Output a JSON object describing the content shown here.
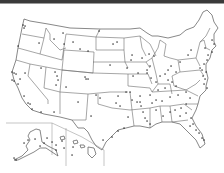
{
  "map": {
    "title": "",
    "type": "us-locations-dot-map",
    "colors": {
      "background": "#ffffff",
      "borders": "#6b6b6b",
      "dots": "#222222",
      "topbar": "#3a3a3a"
    },
    "insets": [
      "Alaska",
      "Hawaii"
    ],
    "points": [
      [
        23,
        25
      ],
      [
        25,
        26
      ],
      [
        24,
        28
      ],
      [
        18,
        46
      ],
      [
        39,
        43
      ],
      [
        63,
        33
      ],
      [
        64,
        44
      ],
      [
        73,
        42
      ],
      [
        54,
        39
      ],
      [
        80,
        49
      ],
      [
        88,
        51
      ],
      [
        99,
        31
      ],
      [
        41,
        68
      ],
      [
        12,
        72
      ],
      [
        14,
        73
      ],
      [
        16,
        74
      ],
      [
        25,
        73
      ],
      [
        20,
        79
      ],
      [
        14,
        81
      ],
      [
        12,
        80
      ],
      [
        18,
        84
      ],
      [
        55,
        72
      ],
      [
        57,
        76
      ],
      [
        58,
        80
      ],
      [
        56,
        85
      ],
      [
        85,
        77
      ],
      [
        86,
        79
      ],
      [
        88,
        79
      ],
      [
        66,
        87
      ],
      [
        24,
        96
      ],
      [
        28,
        103
      ],
      [
        30,
        104
      ],
      [
        32,
        109
      ],
      [
        41,
        112
      ],
      [
        54,
        112
      ],
      [
        78,
        102
      ],
      [
        91,
        116
      ],
      [
        113,
        44
      ],
      [
        117,
        42
      ],
      [
        110,
        65
      ],
      [
        132,
        55
      ],
      [
        142,
        58
      ],
      [
        149,
        54
      ],
      [
        154,
        56
      ],
      [
        150,
        66
      ],
      [
        147,
        70
      ],
      [
        131,
        60
      ],
      [
        127,
        68
      ],
      [
        133,
        76
      ],
      [
        138,
        73
      ],
      [
        147,
        73
      ],
      [
        151,
        78
      ],
      [
        156,
        82
      ],
      [
        160,
        76
      ],
      [
        165,
        74
      ],
      [
        168,
        70
      ],
      [
        171,
        66
      ],
      [
        176,
        72
      ],
      [
        180,
        62
      ],
      [
        188,
        55
      ],
      [
        191,
        50
      ],
      [
        205,
        48
      ],
      [
        212,
        40
      ],
      [
        214,
        44
      ],
      [
        212,
        52
      ],
      [
        208,
        55
      ],
      [
        207,
        60
      ],
      [
        204,
        64
      ],
      [
        200,
        68
      ],
      [
        202,
        70
      ],
      [
        206,
        72
      ],
      [
        203,
        76
      ],
      [
        205,
        79
      ],
      [
        204,
        84
      ],
      [
        207,
        88
      ],
      [
        168,
        80
      ],
      [
        172,
        82
      ],
      [
        176,
        86
      ],
      [
        165,
        88
      ],
      [
        158,
        90
      ],
      [
        150,
        95
      ],
      [
        140,
        96
      ],
      [
        130,
        92
      ],
      [
        118,
        96
      ],
      [
        116,
        103
      ],
      [
        120,
        106
      ],
      [
        96,
        95
      ],
      [
        100,
        98
      ],
      [
        126,
        92
      ],
      [
        132,
        100
      ],
      [
        140,
        102
      ],
      [
        152,
        103
      ],
      [
        156,
        100
      ],
      [
        162,
        101
      ],
      [
        170,
        97
      ],
      [
        178,
        95
      ],
      [
        186,
        92
      ],
      [
        190,
        98
      ],
      [
        186,
        104
      ],
      [
        181,
        108
      ],
      [
        137,
        102
      ],
      [
        141,
        106
      ],
      [
        143,
        112
      ],
      [
        145,
        118
      ],
      [
        147,
        121
      ],
      [
        150,
        124
      ],
      [
        156,
        110
      ],
      [
        163,
        116
      ],
      [
        170,
        112
      ],
      [
        175,
        110
      ],
      [
        180,
        116
      ],
      [
        186,
        113
      ],
      [
        191,
        118
      ],
      [
        193,
        124
      ],
      [
        196,
        130
      ],
      [
        199,
        133
      ],
      [
        202,
        138
      ],
      [
        204,
        140
      ],
      [
        190,
        126
      ],
      [
        128,
        117
      ],
      [
        124,
        128
      ],
      [
        118,
        131
      ],
      [
        112,
        137
      ],
      [
        103,
        140
      ],
      [
        24,
        143
      ],
      [
        28,
        140
      ],
      [
        35,
        139
      ],
      [
        40,
        146
      ],
      [
        44,
        143
      ],
      [
        47,
        138
      ],
      [
        52,
        142
      ],
      [
        56,
        145
      ],
      [
        56,
        150
      ],
      [
        62,
        141
      ],
      [
        64,
        148
      ],
      [
        73,
        147
      ],
      [
        72,
        155
      ],
      [
        16,
        160
      ],
      [
        14,
        158
      ]
    ]
  }
}
